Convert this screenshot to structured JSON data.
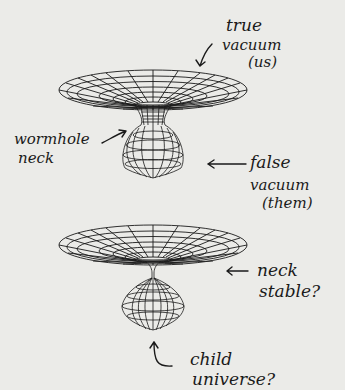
{
  "figure": {
    "top_diagram": {
      "labels": {
        "true_vacuum_line1": "true",
        "true_vacuum_line2": "vacuum",
        "true_vacuum_line3": "(us)",
        "wormhole_line1": "wormhole",
        "wormhole_line2": "neck",
        "false_vacuum_line1": "false",
        "false_vacuum_line2": "vacuum",
        "false_vacuum_line3": "(them)"
      }
    },
    "bottom_diagram": {
      "labels": {
        "neck_line1": "neck",
        "neck_line2": "stable?",
        "child_line1": "child",
        "child_line2": "universe?"
      }
    }
  }
}
